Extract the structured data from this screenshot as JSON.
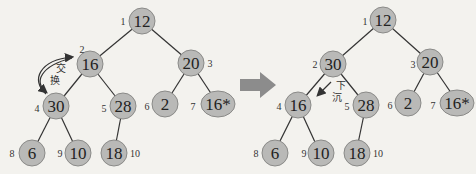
{
  "diagram": {
    "arrow_between": "right-arrow",
    "colors": {
      "node_fill": "#b9b9b7",
      "node_stroke": "#8a8a88",
      "arrow_fill": "#8c8c8c",
      "background": "#f3f2ee"
    },
    "left_tree": {
      "annotation": {
        "label": "交换",
        "chars": [
          "交",
          "换"
        ]
      },
      "nodes": [
        {
          "index": "1",
          "value": "12"
        },
        {
          "index": "2",
          "value": "16"
        },
        {
          "index": "3",
          "value": "20"
        },
        {
          "index": "4",
          "value": "30"
        },
        {
          "index": "5",
          "value": "28"
        },
        {
          "index": "6",
          "value": "2"
        },
        {
          "index": "7",
          "value": "16*"
        },
        {
          "index": "8",
          "value": "6"
        },
        {
          "index": "9",
          "value": "10"
        },
        {
          "index": "10",
          "value": "18"
        }
      ]
    },
    "right_tree": {
      "annotation": {
        "label": "下沉",
        "chars": [
          "下",
          "沉"
        ]
      },
      "nodes": [
        {
          "index": "1",
          "value": "12"
        },
        {
          "index": "2",
          "value": "30"
        },
        {
          "index": "3",
          "value": "20"
        },
        {
          "index": "4",
          "value": "16"
        },
        {
          "index": "5",
          "value": "28"
        },
        {
          "index": "6",
          "value": "2"
        },
        {
          "index": "7",
          "value": "16*"
        },
        {
          "index": "8",
          "value": "6"
        },
        {
          "index": "9",
          "value": "10"
        },
        {
          "index": "10",
          "value": "18"
        }
      ]
    }
  }
}
